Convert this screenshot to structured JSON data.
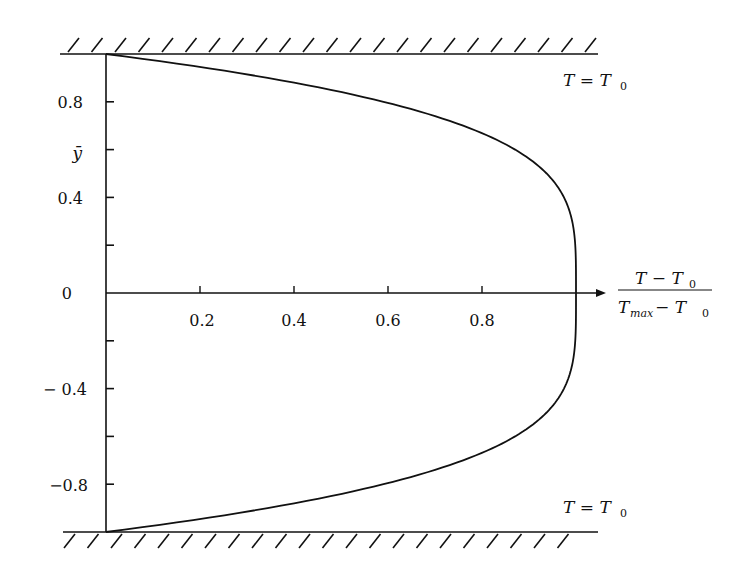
{
  "chart_data": {
    "type": "line",
    "title": "",
    "xlabel_numerator": "T − T",
    "xlabel_numerator_sub": "0",
    "xlabel_denominator": "T",
    "xlabel_denominator_sub": "max",
    "xlabel_denominator_rest": " − T",
    "xlabel_denominator_rest_sub": "0",
    "ylabel": "ȳ",
    "xlim": [
      0,
      1
    ],
    "ylim": [
      -1,
      1
    ],
    "grid": false,
    "x_ticks": [
      0.2,
      0.4,
      0.6,
      0.8
    ],
    "x_tick_labels": [
      "0.2",
      "0.4",
      "0.6",
      "0.8"
    ],
    "y_ticks": [
      -0.8,
      -0.6,
      -0.4,
      -0.2,
      0,
      0.2,
      0.4,
      0.6,
      0.8
    ],
    "y_tick_labels": [
      {
        "value": 0.8,
        "label": "0.8"
      },
      {
        "value": 0.6,
        "label": "ȳ"
      },
      {
        "value": 0.4,
        "label": "0.4"
      },
      {
        "value": 0,
        "label": "0"
      },
      {
        "value": -0.4,
        "label": "− 0.4"
      },
      {
        "value": -0.8,
        "label": "−0.8"
      }
    ],
    "series": [
      {
        "name": "profile",
        "y": [
          -1.0,
          -0.9,
          -0.8,
          -0.7,
          -0.6,
          -0.5,
          -0.4,
          -0.3,
          -0.2,
          -0.1,
          0.0,
          0.1,
          0.2,
          0.3,
          0.4,
          0.5,
          0.6,
          0.7,
          0.8,
          0.9,
          1.0
        ],
        "x": [
          0.0,
          0.34,
          0.59,
          0.76,
          0.87,
          0.94,
          0.97,
          0.99,
          1.0,
          1.0,
          1.0,
          1.0,
          1.0,
          0.99,
          0.97,
          0.94,
          0.87,
          0.76,
          0.59,
          0.34,
          0.0
        ]
      }
    ],
    "annotations": [
      {
        "text": "T = T",
        "sub": "0",
        "position": "top-right, below upper wall"
      },
      {
        "text": "T = T",
        "sub": "0",
        "position": "bottom-right, above lower wall"
      }
    ]
  },
  "labels": {
    "wall_top_T": "T = T",
    "wall_top_sub": "0",
    "wall_bottom_T": "T = T",
    "wall_bottom_sub": "0",
    "y_axis": "ȳ",
    "x_frac_num": "T − T",
    "x_frac_num_sub": "0",
    "x_frac_den_T": "T",
    "x_frac_den_sub": "max",
    "x_frac_den_rest": " − T",
    "x_frac_den_rest_sub": "0",
    "x_ticks": [
      "0.2",
      "0.4",
      "0.6",
      "0.8"
    ],
    "y_tick_08": "0.8",
    "y_tick_04": "0.4",
    "y_tick_0": "0",
    "y_tick_m04": "− 0.4",
    "y_tick_m08": "−0.8"
  }
}
